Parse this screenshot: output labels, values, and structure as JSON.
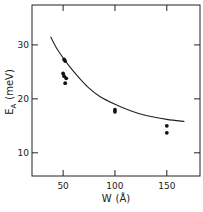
{
  "chart_data": {
    "type": "scatter",
    "title": "",
    "xlabel": "W (Å)",
    "ylabel": "E_A (meV)",
    "xlim": [
      20,
      182
    ],
    "ylim": [
      5.7,
      37.4
    ],
    "x_ticks": [
      50,
      100,
      150
    ],
    "y_ticks": [
      10,
      20,
      30
    ],
    "x_tick_labels": [
      "50",
      "100",
      "150"
    ],
    "y_tick_labels": [
      "10",
      "20",
      "30"
    ],
    "grid": false,
    "legend": null,
    "series": [
      {
        "name": "measured",
        "kind": "scatter",
        "points": [
          {
            "x": 51,
            "y": 27.3
          },
          {
            "x": 52,
            "y": 27.0
          },
          {
            "x": 50,
            "y": 24.7
          },
          {
            "x": 51,
            "y": 24.2
          },
          {
            "x": 53,
            "y": 23.8
          },
          {
            "x": 52,
            "y": 22.9
          },
          {
            "x": 100,
            "y": 18.0
          },
          {
            "x": 100,
            "y": 17.6
          },
          {
            "x": 150,
            "y": 15.0
          },
          {
            "x": 150,
            "y": 13.7
          }
        ]
      },
      {
        "name": "theory",
        "kind": "line",
        "points": [
          {
            "x": 38,
            "y": 31.5
          },
          {
            "x": 45,
            "y": 29.0
          },
          {
            "x": 55,
            "y": 26.3
          },
          {
            "x": 65,
            "y": 24.0
          },
          {
            "x": 75,
            "y": 22.0
          },
          {
            "x": 85,
            "y": 20.5
          },
          {
            "x": 100,
            "y": 19.0
          },
          {
            "x": 115,
            "y": 17.8
          },
          {
            "x": 130,
            "y": 16.9
          },
          {
            "x": 150,
            "y": 16.2
          },
          {
            "x": 167,
            "y": 15.8
          }
        ]
      }
    ]
  },
  "axes": {
    "x_label_main": "W",
    "x_label_unit": "(Å)",
    "y_label_main": "E",
    "y_label_sub": "A",
    "y_label_unit": "(meV)"
  }
}
